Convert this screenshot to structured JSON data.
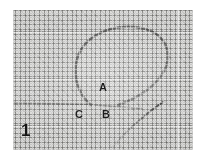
{
  "figure": {
    "number": "1",
    "kind": "micrograph",
    "plate": {
      "background_color": "#d8d8d6",
      "texture": "halftone-woven-screen",
      "border_color": "#ffffff",
      "ink_color": "#5a5a58"
    },
    "labels": [
      {
        "id": "A",
        "text": "A",
        "x": 102,
        "y": 88
      },
      {
        "id": "B",
        "text": "B",
        "x": 105,
        "y": 115
      },
      {
        "id": "C",
        "text": "C",
        "x": 78,
        "y": 114
      }
    ],
    "structures": [
      {
        "name": "loop",
        "description": "large teardrop-shaped filament loop occupying the upper centre of the plate"
      },
      {
        "name": "horizontal-filament",
        "description": "straight filament running left from the base of the loop to the left edge"
      },
      {
        "name": "tail-filament",
        "description": "diagonal filament descending from the loop base toward the lower right"
      }
    ]
  }
}
